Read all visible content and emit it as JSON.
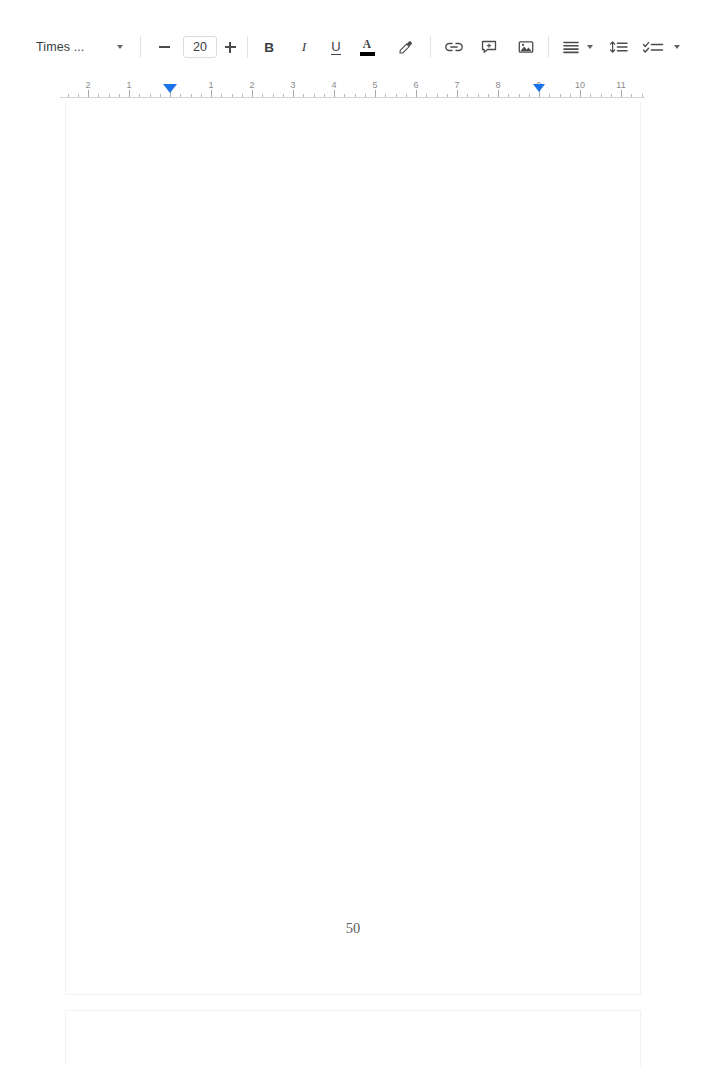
{
  "app": {
    "type": "document-editor",
    "accent_color": "#1a73e8",
    "page_background": "#ffffff",
    "canvas_background": "#ffffff"
  },
  "toolbar": {
    "font_name": "Times ...",
    "font_name_caret": "chevron-down",
    "decrease_font_label": "−",
    "font_size_value": "20",
    "increase_font_label": "+",
    "bold_label": "B",
    "italic_label": "I",
    "underline_label": "U",
    "text_color_label": "A",
    "text_color_swatch": "#000000",
    "highlight_label": "highlight-pen",
    "insert_link_label": "link",
    "add_comment_label": "comment",
    "insert_image_label": "image",
    "align_label": "align",
    "align_caret": "chevron-down",
    "line_spacing_label": "line-spacing",
    "list_label": "checklist",
    "list_caret": "chevron-down"
  },
  "ruler": {
    "unit": "inches",
    "left_numbers": [
      "2",
      "1"
    ],
    "right_numbers": [
      "1",
      "2",
      "3",
      "4",
      "5",
      "6",
      "7",
      "8",
      "9",
      "10",
      "11"
    ],
    "left_indent_position": "0",
    "right_indent_position": "9",
    "marker_color": "#1a73e8"
  },
  "document": {
    "pages": [
      {
        "page_number": "50",
        "body_text": ""
      },
      {
        "page_number": "",
        "body_text": ""
      }
    ]
  }
}
